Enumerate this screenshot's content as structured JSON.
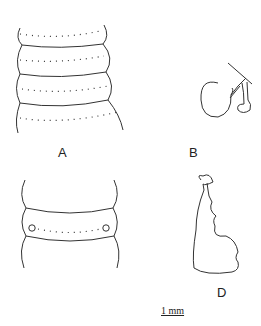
{
  "figure": {
    "panels": [
      {
        "id": "A",
        "label": "A",
        "description": "dorsal view of body segments with setae rows"
      },
      {
        "id": "B",
        "label": "B",
        "description": "spermatheca"
      },
      {
        "id": "C",
        "label": "",
        "description": "clitellar segment with paired pores"
      },
      {
        "id": "D",
        "label": "D",
        "description": "lobed organ"
      }
    ],
    "scale_bar": {
      "label": "1 mm"
    },
    "stroke_color": "#333333",
    "background": "#ffffff"
  }
}
